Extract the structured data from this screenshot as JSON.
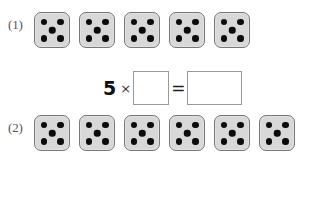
{
  "worksheet": {
    "title": "Multiplication with dice groups",
    "background_color": "#ffffff",
    "die_face_color": "#d8d8d8",
    "die_border_color": "#777777",
    "pip_color": "#0b0b0b",
    "box_border_color": "#9a9a9a"
  },
  "problems": [
    {
      "label": "(1)",
      "dice_count": 5,
      "pips_per_die": 5,
      "dice": [
        {
          "face": 5
        },
        {
          "face": 5
        },
        {
          "face": 5
        },
        {
          "face": 5
        },
        {
          "face": 5
        }
      ],
      "equation": {
        "factor": "5",
        "times_symbol": "×",
        "equals_symbol": "=",
        "operand_value": "",
        "result_value": ""
      }
    },
    {
      "label": "(2)",
      "dice_count": 6,
      "pips_per_die": 5,
      "dice": [
        {
          "face": 5
        },
        {
          "face": 5
        },
        {
          "face": 5
        },
        {
          "face": 5
        },
        {
          "face": 5
        },
        {
          "face": 5
        }
      ],
      "equation": {
        "factor": "5",
        "times_symbol": "×",
        "equals_symbol": "=",
        "operand_value": "",
        "result_value": ""
      }
    }
  ]
}
